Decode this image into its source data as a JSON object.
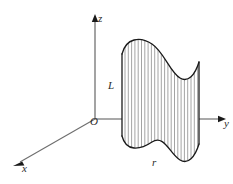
{
  "figure": {
    "background_color": "#ffffff",
    "width": 233,
    "height": 184
  },
  "axes": {
    "color": "#8c8c8c",
    "arrow_color": "#1a1a1a",
    "origin": {
      "label": "O",
      "x": 95,
      "y": 119
    },
    "items": [
      {
        "name": "z-axis",
        "label": "z",
        "direction": "up",
        "from": [
          95,
          119
        ],
        "to": [
          95,
          18
        ]
      },
      {
        "name": "y-axis",
        "label": "y",
        "direction": "right",
        "from": [
          95,
          119
        ],
        "to": [
          226,
          119
        ]
      },
      {
        "name": "x-axis",
        "label": "x",
        "direction": "down-left",
        "from": [
          95,
          119
        ],
        "to": [
          14,
          166
        ]
      }
    ]
  },
  "surface": {
    "name": "ruled-cylindrical-surface",
    "outline_color": "#1a1a1a",
    "hatch_color": "#9a9a9a",
    "hatch_count": 24,
    "fill": "#ffffff",
    "labels": {
      "generatrix": "L",
      "directrix": "r"
    },
    "top_curve": "wavy S-curve with crest at left and valley at right",
    "bottom_curve": "wavy S-curve with crest at left and valley at right",
    "left_edge_x": 122,
    "right_edge_x": 200
  },
  "colors": {
    "ink": "#1a1a1a",
    "axis": "#8c8c8c",
    "hatch": "#9a9a9a",
    "paper": "#ffffff"
  }
}
